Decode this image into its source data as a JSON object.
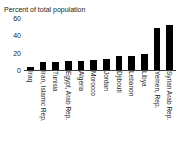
{
  "chart_data": {
    "type": "bar",
    "title": "Percent of total population",
    "xlabel": "",
    "ylabel": "",
    "ylim": [
      0,
      60
    ],
    "yticks": [
      0,
      20,
      40,
      60
    ],
    "grid": false,
    "legend": false,
    "bar_color": "#000000",
    "categories": [
      "Iraq",
      "Iran, Islamic Rep.",
      "Tunisia",
      "Egypt, Arab Rep.",
      "Algeria",
      "Morocco",
      "Jordan",
      "Djibouti",
      "Lebanon",
      "Libya",
      "Yemen, Rep.",
      "Syrian Arab Rep."
    ],
    "values": [
      4,
      9,
      9.5,
      10,
      10.5,
      12,
      13,
      16,
      16.5,
      18,
      49,
      52
    ]
  }
}
